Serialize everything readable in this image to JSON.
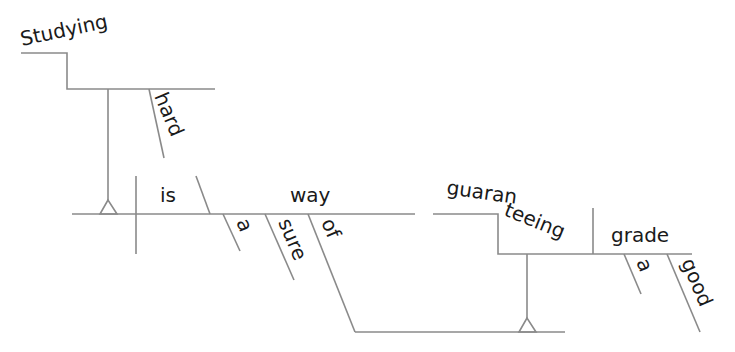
{
  "diagram": {
    "type": "sentence-diagram",
    "sentence": "Studying hard is a sure way of guaranteeing a good grade.",
    "words": {
      "subject": "Studying",
      "subject_modifier": "hard",
      "verb": "is",
      "predicate_noun": "way",
      "article1": "a",
      "adjective1": "sure",
      "preposition": "of",
      "gerund": "guaranteeing",
      "gerund_part1": "guaran",
      "gerund_part2": "teeing",
      "object": "grade",
      "article2": "a",
      "adjective2": "good"
    },
    "colors": {
      "line": "#8a8a8a",
      "text": "#1a1a1a",
      "background": "#ffffff"
    }
  }
}
